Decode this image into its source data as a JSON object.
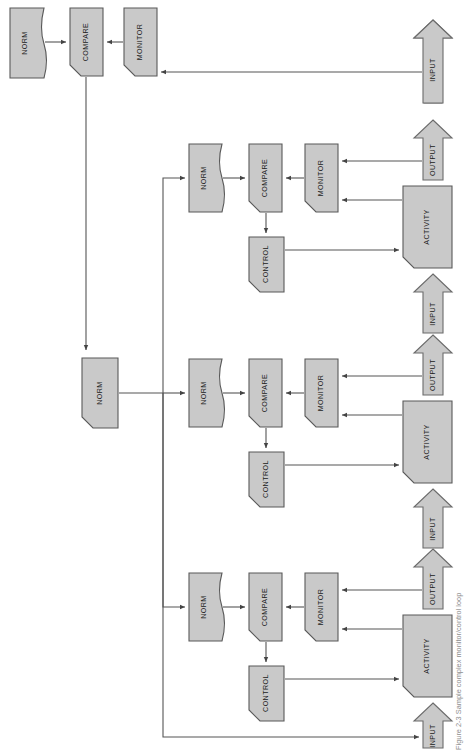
{
  "figure": {
    "caption": "Figure 2-3  Sample complex monitor/control loop",
    "orientation": "rotated-90-ccw",
    "canvas": {
      "width": 465,
      "height": 754
    },
    "colors": {
      "shape_fill": "#c9c9c9",
      "shape_stroke": "#595959",
      "arrow_fill": "#c9c9c9",
      "arrow_stroke": "#6b6b6b",
      "connector": "#555555",
      "label_text": "#1a1a1a",
      "caption_text": "#8e8e8e",
      "background": "#ffffff"
    }
  },
  "labels": {
    "norm": "NORM",
    "compare": "COMPARE",
    "monitor": "MONITOR",
    "control": "CONTROL",
    "activity": "ACTIVITY",
    "input": "INPUT",
    "output": "OUTPUT"
  },
  "nodes": [
    {
      "id": "top-norm",
      "label": "NORM",
      "shape": "document",
      "group": "supervisory-loop"
    },
    {
      "id": "top-compare",
      "label": "COMPARE",
      "shape": "cut-corner",
      "group": "supervisory-loop"
    },
    {
      "id": "top-monitor",
      "label": "MONITOR",
      "shape": "cut-corner",
      "group": "supervisory-loop"
    },
    {
      "id": "top-input",
      "label": "INPUT",
      "shape": "block-arrow",
      "group": "supervisory-loop"
    },
    {
      "id": "master-norm",
      "label": "NORM",
      "shape": "cut-corner",
      "group": "distribution"
    },
    {
      "id": "loop1-norm",
      "label": "NORM",
      "shape": "document",
      "group": "loop-1"
    },
    {
      "id": "loop1-compare",
      "label": "COMPARE",
      "shape": "cut-corner",
      "group": "loop-1"
    },
    {
      "id": "loop1-monitor",
      "label": "MONITOR",
      "shape": "cut-corner",
      "group": "loop-1"
    },
    {
      "id": "loop1-control",
      "label": "CONTROL",
      "shape": "cut-corner",
      "group": "loop-1"
    },
    {
      "id": "loop1-activity",
      "label": "ACTIVITY",
      "shape": "cut-corner",
      "group": "loop-1"
    },
    {
      "id": "loop1-input",
      "label": "INPUT",
      "shape": "block-arrow",
      "group": "loop-1"
    },
    {
      "id": "loop1-output",
      "label": "OUTPUT",
      "shape": "block-arrow",
      "group": "loop-1"
    },
    {
      "id": "loop2-norm",
      "label": "NORM",
      "shape": "document",
      "group": "loop-2"
    },
    {
      "id": "loop2-compare",
      "label": "COMPARE",
      "shape": "cut-corner",
      "group": "loop-2"
    },
    {
      "id": "loop2-monitor",
      "label": "MONITOR",
      "shape": "cut-corner",
      "group": "loop-2"
    },
    {
      "id": "loop2-control",
      "label": "CONTROL",
      "shape": "cut-corner",
      "group": "loop-2"
    },
    {
      "id": "loop2-activity",
      "label": "ACTIVITY",
      "shape": "cut-corner",
      "group": "loop-2"
    },
    {
      "id": "loop2-input",
      "label": "INPUT",
      "shape": "block-arrow",
      "group": "loop-2"
    },
    {
      "id": "loop2-output",
      "label": "OUTPUT",
      "shape": "block-arrow",
      "group": "loop-2"
    },
    {
      "id": "loop3-norm",
      "label": "NORM",
      "shape": "document",
      "group": "loop-3"
    },
    {
      "id": "loop3-compare",
      "label": "COMPARE",
      "shape": "cut-corner",
      "group": "loop-3"
    },
    {
      "id": "loop3-monitor",
      "label": "MONITOR",
      "shape": "cut-corner",
      "group": "loop-3"
    },
    {
      "id": "loop3-control",
      "label": "CONTROL",
      "shape": "cut-corner",
      "group": "loop-3"
    },
    {
      "id": "loop3-activity",
      "label": "ACTIVITY",
      "shape": "cut-corner",
      "group": "loop-3"
    },
    {
      "id": "loop3-input",
      "label": "INPUT",
      "shape": "block-arrow",
      "group": "loop-3"
    },
    {
      "id": "loop3-output",
      "label": "OUTPUT",
      "shape": "block-arrow",
      "group": "loop-3"
    }
  ],
  "edges": [
    {
      "from": "top-norm",
      "to": "top-compare"
    },
    {
      "from": "top-monitor",
      "to": "top-compare"
    },
    {
      "from": "top-input",
      "to": "top-monitor"
    },
    {
      "from": "top-compare",
      "to": "master-norm"
    },
    {
      "from": "master-norm",
      "to": "loop1-norm"
    },
    {
      "from": "master-norm",
      "to": "loop2-norm"
    },
    {
      "from": "master-norm",
      "to": "loop3-norm"
    },
    {
      "from": "loop1-norm",
      "to": "loop1-compare"
    },
    {
      "from": "loop1-monitor",
      "to": "loop1-compare"
    },
    {
      "from": "loop1-compare",
      "to": "loop1-control"
    },
    {
      "from": "loop1-control",
      "to": "loop1-activity"
    },
    {
      "from": "loop1-activity",
      "to": "loop1-monitor"
    },
    {
      "from": "loop1-output",
      "to": "loop1-monitor"
    },
    {
      "from": "loop1-input",
      "to": "loop1-activity"
    },
    {
      "from": "loop2-norm",
      "to": "loop2-compare"
    },
    {
      "from": "loop2-monitor",
      "to": "loop2-compare"
    },
    {
      "from": "loop2-compare",
      "to": "loop2-control"
    },
    {
      "from": "loop2-control",
      "to": "loop2-activity"
    },
    {
      "from": "loop2-activity",
      "to": "loop2-monitor"
    },
    {
      "from": "loop2-output",
      "to": "loop2-monitor"
    },
    {
      "from": "loop2-input",
      "to": "loop2-activity"
    },
    {
      "from": "loop3-norm",
      "to": "loop3-compare"
    },
    {
      "from": "loop3-monitor",
      "to": "loop3-compare"
    },
    {
      "from": "loop3-compare",
      "to": "loop3-control"
    },
    {
      "from": "loop3-control",
      "to": "loop3-activity"
    },
    {
      "from": "loop3-activity",
      "to": "loop3-monitor"
    },
    {
      "from": "loop3-output",
      "to": "loop3-monitor"
    },
    {
      "from": "loop3-input",
      "to": "loop3-activity"
    },
    {
      "from": "loop3-input",
      "to": "top-monitor",
      "routing": "long-feedback"
    }
  ]
}
